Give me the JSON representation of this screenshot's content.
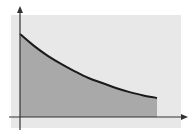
{
  "chart_data": {
    "type": "area",
    "title": "",
    "xlabel": "",
    "ylabel": "",
    "curve": "exponential-decay",
    "x": [
      0,
      0.1,
      0.2,
      0.3,
      0.4,
      0.5,
      0.6,
      0.7,
      0.8,
      0.9,
      1.0
    ],
    "y": [
      1.0,
      0.86,
      0.74,
      0.64,
      0.55,
      0.47,
      0.41,
      0.35,
      0.3,
      0.26,
      0.23
    ],
    "shaded_region": {
      "from_x": 0,
      "to_x": 1.0
    },
    "grid": false,
    "legend": null,
    "axes": {
      "x_arrow": true,
      "y_arrow": true,
      "tick_labels": false
    }
  },
  "colors": {
    "panel_background": "#e8e8e8",
    "shaded_area": "#a9a9a9",
    "curve": "#1a1a1a",
    "axes": "#333333"
  }
}
